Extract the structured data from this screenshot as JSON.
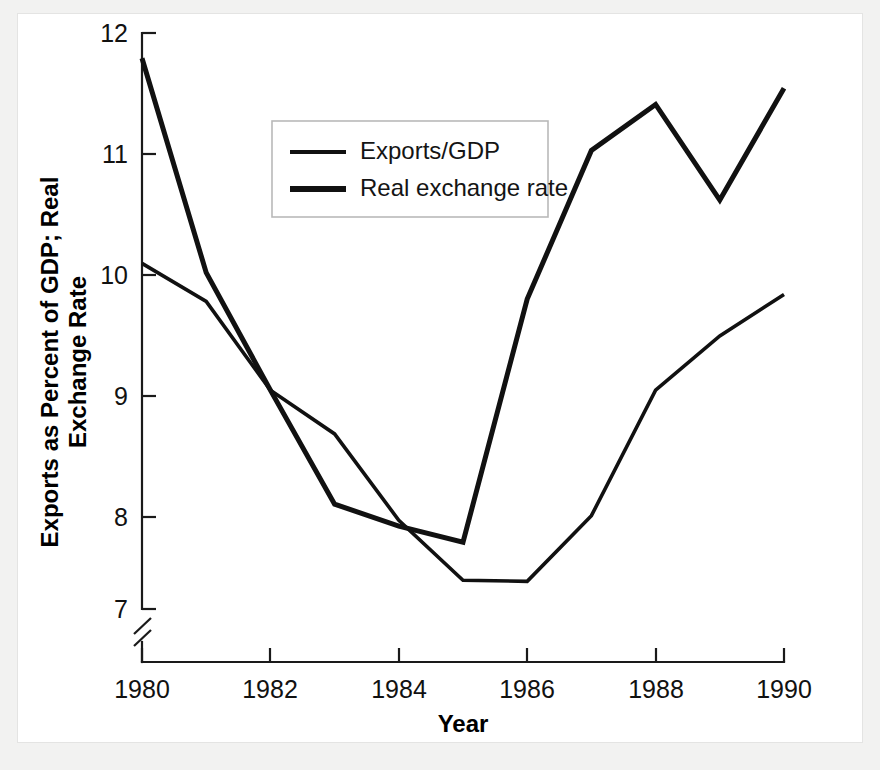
{
  "chart_data": {
    "type": "line",
    "title": "",
    "xlabel": "Year",
    "ylabel": "Exports as Percent of GDP; Real Exchange Rate",
    "ylabel_line1": "Exports as Percent of GDP; Real",
    "ylabel_line2": "Exchange Rate",
    "x": [
      1980,
      1981,
      1982,
      1983,
      1984,
      1985,
      1986,
      1987,
      1988,
      1989,
      1990
    ],
    "categories": [
      "1980",
      "1981",
      "1982",
      "1983",
      "1984",
      "1985",
      "1986",
      "1987",
      "1988",
      "1989",
      "1990"
    ],
    "xtick_labels": [
      "1980",
      "1982",
      "1984",
      "1986",
      "1988",
      "1990"
    ],
    "xtick_values": [
      1980,
      1982,
      1984,
      1986,
      1988,
      1990
    ],
    "ytick_labels": [
      "7",
      "8",
      "9",
      "10",
      "11",
      "12"
    ],
    "ytick_values": [
      7,
      8,
      9,
      10,
      11,
      12
    ],
    "xlim": [
      1980,
      1990
    ],
    "ylim": [
      7,
      12
    ],
    "y_axis_break": true,
    "y_axis_break_note": "axis broken below 7",
    "grid": false,
    "legend_position": "upper-left-inside",
    "series": [
      {
        "name": "Exports/GDP",
        "style": "thin",
        "values": [
          10.0,
          9.67,
          8.9,
          8.52,
          7.77,
          7.25,
          7.24,
          7.81,
          8.9,
          9.37,
          9.73
        ]
      },
      {
        "name": "Real exchange rate",
        "style": "thick",
        "values": [
          11.78,
          9.92,
          8.9,
          7.91,
          7.72,
          7.58,
          9.69,
          10.98,
          11.38,
          10.55,
          11.52
        ]
      }
    ]
  },
  "legend": {
    "entries": [
      {
        "label": "Exports/GDP"
      },
      {
        "label": "Real exchange rate"
      }
    ]
  },
  "axes": {
    "x_title": "Year",
    "y_title_line1": "Exports as Percent of GDP; Real",
    "y_title_line2": "Exchange Rate"
  },
  "colors": {
    "line": "#111111",
    "axis": "#1a1a1a",
    "panel_background": "#ffffff",
    "page_background": "#f2f2f1",
    "legend_border": "#b9b9b9"
  }
}
